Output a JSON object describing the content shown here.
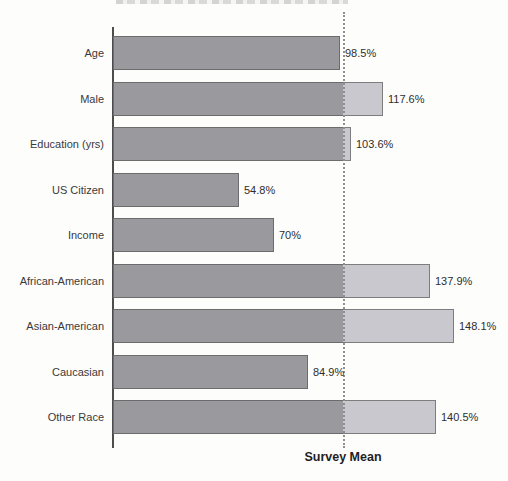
{
  "chart_data": {
    "type": "bar",
    "orientation": "horizontal",
    "title": "",
    "categories": [
      "Age",
      "Male",
      "Education (yrs)",
      "US Citizen",
      "Income",
      "African-American",
      "Asian-American",
      "Caucasian",
      "Other Race"
    ],
    "values": [
      98.5,
      117.6,
      103.6,
      54.8,
      70,
      137.9,
      148.1,
      84.9,
      140.5
    ],
    "value_labels": [
      "98.5%",
      "117.6%",
      "103.6%",
      "54.8%",
      "70%",
      "137.9%",
      "148.1%",
      "84.9%",
      "140.5%"
    ],
    "unit": "%",
    "xlim": [
      0,
      160
    ],
    "grid": false,
    "reference_line": {
      "label": "Survey Mean",
      "value": 100,
      "style": "dotted"
    },
    "colors": {
      "bar_fill": "#9a9a9e",
      "bar_border": "#6c6c6c",
      "overflow_fill": "#c8c8ce",
      "overflow_border": "#7d7d7d",
      "reference_line": "#8f8f8f",
      "axis_line": "#4d4d4d",
      "text": "#2e2e2e"
    }
  }
}
